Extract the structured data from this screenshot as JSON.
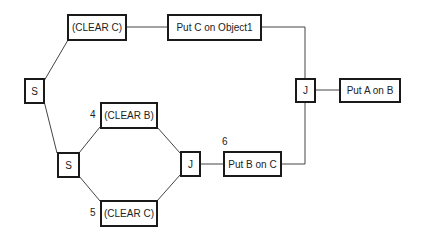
{
  "diagram": {
    "nodes": {
      "clear_c_top": "(CLEAR C)",
      "put_c_on_object1": "Put C on Object1",
      "split_top": "S",
      "join_right": "J",
      "put_a_on_b": "Put A on B",
      "clear_b": "(CLEAR B)",
      "split_inner": "S",
      "join_inner": "J",
      "put_b_on_c": "Put B on C",
      "clear_c_bottom": "(CLEAR C)"
    },
    "labels": {
      "clear_b_num": "4",
      "clear_c_bottom_num": "5",
      "put_b_on_c_num": "6"
    }
  }
}
